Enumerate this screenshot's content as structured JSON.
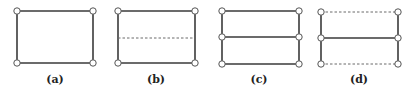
{
  "panels": [
    {
      "id": "a",
      "label": "(a)",
      "box": {
        "x1": 17,
        "y1": 11,
        "x2": 93,
        "y2": 63
      },
      "edges": [
        {
          "y": 11,
          "style": "solid"
        },
        {
          "y": 63,
          "style": "solid"
        }
      ],
      "verticals": "solid",
      "nodes": [
        [
          17,
          11
        ],
        [
          93,
          11
        ],
        [
          17,
          63
        ],
        [
          93,
          63
        ]
      ],
      "label_pos": [
        55,
        83
      ]
    },
    {
      "id": "b",
      "label": "(b)",
      "box": {
        "x1": 118,
        "y1": 11,
        "x2": 195,
        "y2": 63
      },
      "edges": [
        {
          "y": 11,
          "style": "solid"
        },
        {
          "y": 38,
          "style": "dashed"
        },
        {
          "y": 63,
          "style": "solid"
        }
      ],
      "verticals": "solid",
      "nodes": [
        [
          118,
          11
        ],
        [
          195,
          11
        ],
        [
          118,
          63
        ],
        [
          195,
          63
        ]
      ],
      "label_pos": [
        156,
        83
      ]
    },
    {
      "id": "c",
      "label": "(c)",
      "box": {
        "x1": 222,
        "y1": 11,
        "x2": 299,
        "y2": 64
      },
      "edges": [
        {
          "y": 11,
          "style": "solid"
        },
        {
          "y": 37,
          "style": "solid"
        },
        {
          "y": 64,
          "style": "solid"
        }
      ],
      "verticals": "solid",
      "nodes": [
        [
          222,
          11
        ],
        [
          299,
          11
        ],
        [
          222,
          37
        ],
        [
          299,
          37
        ],
        [
          222,
          64
        ],
        [
          299,
          64
        ]
      ],
      "label_pos": [
        259,
        83
      ]
    },
    {
      "id": "d",
      "label": "(d)",
      "box": {
        "x1": 321,
        "y1": 12,
        "x2": 398,
        "y2": 64
      },
      "edges": [
        {
          "y": 12,
          "style": "dashed"
        },
        {
          "y": 38,
          "style": "solid"
        },
        {
          "y": 64,
          "style": "dashed"
        }
      ],
      "verticals": "solid",
      "nodes": [
        [
          321,
          12
        ],
        [
          398,
          12
        ],
        [
          321,
          38
        ],
        [
          398,
          38
        ],
        [
          321,
          64
        ],
        [
          398,
          64
        ]
      ],
      "label_pos": [
        359,
        83
      ]
    }
  ],
  "colors": {
    "line": "#3a3a3a",
    "dashed": "#6a6a6a",
    "node_fill": "#ffffff",
    "node_stroke": "#555555"
  }
}
